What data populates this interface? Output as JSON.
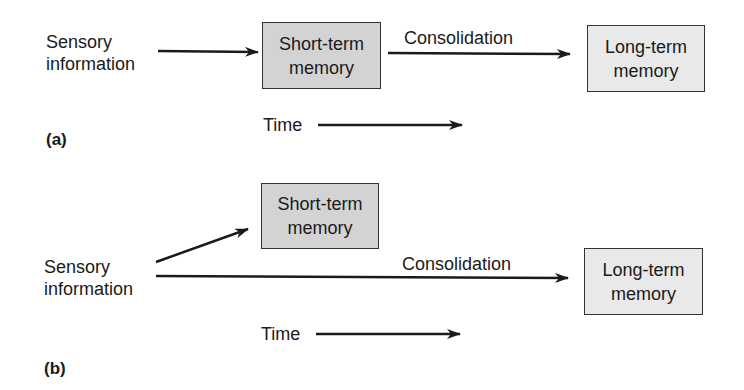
{
  "panel_a": {
    "label": "(a)",
    "input": {
      "line1": "Sensory",
      "line2": "information"
    },
    "short_term": {
      "line1": "Short-term",
      "line2": "memory"
    },
    "consolidation": "Consolidation",
    "long_term": {
      "line1": "Long-term",
      "line2": "memory"
    },
    "time": "Time"
  },
  "panel_b": {
    "label": "(b)",
    "input": {
      "line1": "Sensory",
      "line2": "information"
    },
    "short_term": {
      "line1": "Short-term",
      "line2": "memory"
    },
    "consolidation": "Consolidation",
    "long_term": {
      "line1": "Long-term",
      "line2": "memory"
    },
    "time": "Time"
  },
  "colors": {
    "short_term_fill": "#d3d3d3",
    "long_term_fill": "#e9e9e9",
    "stroke": "#1a1a1a"
  }
}
